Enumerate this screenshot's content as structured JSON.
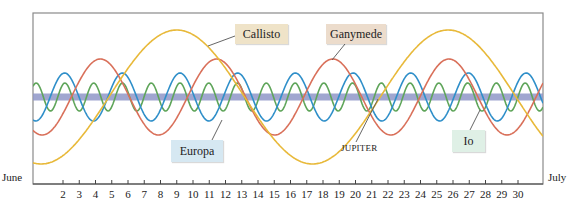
{
  "chart_data": {
    "type": "line",
    "title": "",
    "xlabel": "",
    "ylabel": "",
    "x_start_label": "June",
    "x_end_label": "July",
    "categories": [
      "2",
      "3",
      "4",
      "5",
      "6",
      "7",
      "8",
      "9",
      "10",
      "11",
      "12",
      "13",
      "14",
      "15",
      "16",
      "17",
      "18",
      "19",
      "20",
      "21",
      "22",
      "23",
      "24",
      "25",
      "26",
      "27",
      "28",
      "29",
      "30"
    ],
    "xlim": [
      0.2,
      31.5
    ],
    "grid": false,
    "legend": "callout labels",
    "center_line": {
      "name": "JUPITER",
      "color": "#8f97c8"
    },
    "series": [
      {
        "name": "Io",
        "color": "#5fa55a",
        "period_days": 1.77,
        "amplitude": 14,
        "first_peak_day": 0.35
      },
      {
        "name": "Europa",
        "color": "#2f8fc9",
        "period_days": 3.55,
        "amplitude": 24,
        "first_peak_day": 2.1
      },
      {
        "name": "Ganymede",
        "color": "#d9705a",
        "period_days": 7.15,
        "amplitude": 38,
        "first_peak_day": 4.3
      },
      {
        "name": "Callisto",
        "color": "#e8b93a",
        "period_days": 16.7,
        "amplitude": 67,
        "first_peak_day": 9.0
      }
    ]
  },
  "labels": {
    "callisto": "Callisto",
    "ganymede": "Ganymede",
    "europa": "Europa",
    "io": "Io",
    "jupiter": "JUPITER",
    "june": "June",
    "july": "July"
  }
}
